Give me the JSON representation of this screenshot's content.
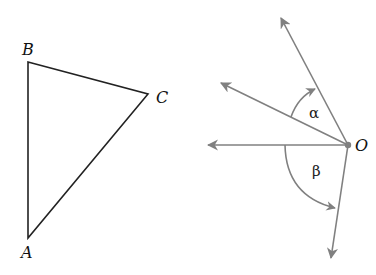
{
  "triangle": {
    "vertices": [
      {
        "label": "A",
        "x": 28,
        "y": 238
      },
      {
        "label": "B",
        "x": 28,
        "y": 62
      },
      {
        "label": "C",
        "x": 148,
        "y": 94
      }
    ],
    "stroke_color": "#222222"
  },
  "rays": {
    "origin": {
      "label": "O",
      "x": 348,
      "y": 145
    },
    "arrow_color": "#808080",
    "tips": [
      {
        "name": "ray-up",
        "x": 281,
        "y": 18
      },
      {
        "name": "ray-upper-left",
        "x": 221,
        "y": 83
      },
      {
        "name": "ray-left",
        "x": 208,
        "y": 145
      },
      {
        "name": "ray-down",
        "x": 331,
        "y": 258
      }
    ],
    "angles": [
      {
        "label": "α",
        "between": [
          "ray-upper-left",
          "ray-up"
        ]
      },
      {
        "label": "β",
        "between": [
          "ray-left",
          "ray-down"
        ]
      }
    ]
  }
}
